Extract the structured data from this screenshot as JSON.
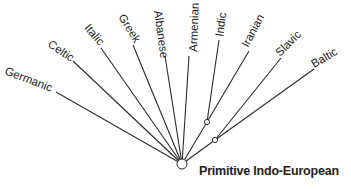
{
  "root": {
    "label": "Primitive Indo-European",
    "x": 182,
    "y": 164
  },
  "branches": [
    {
      "label": "Germanic",
      "x2": 56,
      "y2": 92,
      "angle": 21,
      "lx": 4,
      "ly": 74
    },
    {
      "label": "Celtic",
      "x2": 73,
      "y2": 61,
      "angle": 34,
      "lx": 47,
      "ly": 46
    },
    {
      "label": "Italic",
      "x2": 101,
      "y2": 48,
      "angle": 50,
      "lx": 84,
      "ly": 28
    },
    {
      "label": "Greek",
      "x2": 133,
      "y2": 45,
      "angle": 58,
      "lx": 118,
      "ly": 17
    },
    {
      "label": "Albanese",
      "x2": 165,
      "y2": 56,
      "angle": 82,
      "lx": 154,
      "ly": 11
    },
    {
      "label": "Armenian",
      "x2": 189,
      "y2": 56,
      "angle": -88,
      "lx": 197,
      "ly": 52
    },
    {
      "label": "Indic",
      "x2": 219,
      "y2": 40,
      "angle": -82,
      "lx": 223,
      "ly": 37
    },
    {
      "label": "Iranian",
      "x2": 249,
      "y2": 51,
      "angle": -62,
      "lx": 248,
      "ly": 48
    },
    {
      "label": "Slavic",
      "x2": 281,
      "y2": 58,
      "angle": -45,
      "lx": 280,
      "ly": 57
    },
    {
      "label": "Baltic",
      "x2": 314,
      "y2": 69,
      "angle": -30,
      "lx": 314,
      "ly": 68
    }
  ],
  "intermediate_nodes": [
    {
      "name": "indo-iranian-node",
      "x": 207,
      "y": 122,
      "joins": [
        "Indic",
        "Iranian"
      ]
    },
    {
      "name": "balto-slavic-node",
      "x": 215,
      "y": 140,
      "joins": [
        "Slavic",
        "Baltic"
      ]
    }
  ]
}
